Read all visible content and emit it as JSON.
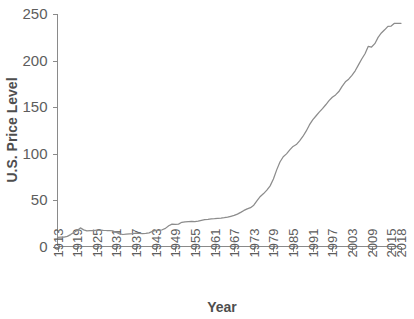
{
  "chart_data": {
    "type": "line",
    "title": "",
    "xlabel": "Year",
    "ylabel": "U.S. Price Level",
    "xlim": [
      1913,
      2018
    ],
    "ylim": [
      0,
      250
    ],
    "grid": false,
    "legend": "none",
    "series": [
      {
        "name": "U.S. Price Level",
        "color": "#8c8c8c",
        "x": [
          1913,
          1914,
          1915,
          1916,
          1917,
          1918,
          1919,
          1920,
          1921,
          1922,
          1923,
          1924,
          1925,
          1926,
          1927,
          1928,
          1929,
          1930,
          1931,
          1932,
          1933,
          1934,
          1935,
          1936,
          1937,
          1938,
          1939,
          1940,
          1941,
          1942,
          1943,
          1944,
          1945,
          1946,
          1947,
          1948,
          1949,
          1950,
          1951,
          1952,
          1953,
          1954,
          1955,
          1956,
          1957,
          1958,
          1959,
          1960,
          1961,
          1962,
          1963,
          1964,
          1965,
          1966,
          1967,
          1968,
          1969,
          1970,
          1971,
          1972,
          1973,
          1974,
          1975,
          1976,
          1977,
          1978,
          1979,
          1980,
          1981,
          1982,
          1983,
          1984,
          1985,
          1986,
          1987,
          1988,
          1989,
          1990,
          1991,
          1992,
          1993,
          1994,
          1995,
          1996,
          1997,
          1998,
          1999,
          2000,
          2001,
          2002,
          2003,
          2004,
          2005,
          2006,
          2007,
          2008,
          2009,
          2010,
          2011,
          2012,
          2013,
          2014,
          2015,
          2016,
          2017,
          2018
        ],
        "values": [
          9.9,
          10.0,
          10.1,
          10.9,
          12.8,
          15.1,
          17.3,
          20.0,
          17.9,
          16.8,
          17.1,
          17.1,
          17.5,
          17.7,
          17.4,
          17.2,
          17.2,
          16.7,
          15.2,
          13.6,
          12.9,
          13.4,
          13.7,
          13.9,
          14.4,
          14.1,
          13.9,
          14.0,
          14.7,
          16.3,
          17.3,
          17.6,
          18.0,
          19.5,
          22.3,
          24.0,
          23.8,
          24.1,
          26.0,
          26.6,
          26.8,
          26.9,
          26.8,
          27.2,
          28.1,
          28.9,
          29.2,
          29.6,
          29.9,
          30.3,
          30.6,
          31.0,
          31.5,
          32.5,
          33.4,
          34.8,
          36.7,
          38.8,
          40.5,
          41.8,
          44.4,
          49.3,
          53.8,
          56.9,
          60.6,
          65.2,
          72.6,
          82.4,
          90.9,
          96.5,
          99.6,
          103.9,
          107.6,
          109.6,
          113.6,
          118.3,
          124.0,
          130.7,
          136.2,
          140.3,
          144.5,
          148.2,
          152.4,
          156.9,
          160.5,
          163.0,
          166.6,
          172.2,
          177.1,
          179.9,
          184.0,
          188.9,
          195.3,
          201.6,
          207.3,
          215.3,
          214.5,
          218.1,
          224.9,
          229.6,
          233.0,
          236.7,
          237.0,
          240.0,
          245.1,
          251.1
        ],
        "end_value_approx": 240
      }
    ],
    "x_ticks": [
      "1913",
      "1919",
      "1925",
      "1931",
      "1937",
      "1943",
      "1949",
      "1955",
      "1961",
      "1967",
      "1973",
      "1979",
      "1985",
      "1991",
      "1997",
      "2003",
      "2009",
      "2015",
      "2018"
    ],
    "y_ticks": [
      "0",
      "50",
      "100",
      "150",
      "200",
      "250"
    ]
  }
}
